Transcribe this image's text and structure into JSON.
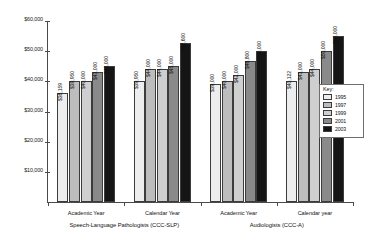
{
  "chart_data": {
    "type": "bar",
    "title": "",
    "xlabel": "",
    "ylabel": "",
    "ylim": [
      0,
      60000
    ],
    "grid": false,
    "legend_position": "right",
    "y_ticks": [
      "$10,000",
      "$20,000",
      "$30,000",
      "$40,000",
      "$50,000",
      "$60,000"
    ],
    "y_tick_values": [
      10000,
      20000,
      30000,
      40000,
      50000,
      60000
    ],
    "series": [
      {
        "name": "1995",
        "color": "#ededed"
      },
      {
        "name": "1997",
        "color": "#bdbdbd"
      },
      {
        "name": "1999",
        "color": "#cfcfcf"
      },
      {
        "name": "2001",
        "color": "#8a8a8a"
      },
      {
        "name": "2003",
        "color": "#151515"
      }
    ],
    "categories": [
      "Academic Year",
      "Calendar Year",
      "Academic Year",
      "Calendar year"
    ],
    "sections": [
      "Speech-Language Pathologists (CCC-SLP)",
      "Audiologists (CCC-A)"
    ],
    "groups": [
      {
        "category": "Academic Year",
        "section": "Speech-Language Pathologists (CCC-SLP)",
        "values": [
          36159,
          39950,
          40000,
          43000,
          45000
        ],
        "labels": [
          "$36,159",
          "$39,950",
          "$40,000",
          "$43,000",
          "$45,000"
        ]
      },
      {
        "category": "Calendar Year",
        "section": "Speech-Language Pathologists (CCC-SLP)",
        "values": [
          39950,
          44000,
          44000,
          45000,
          52600
        ],
        "labels": [
          "$39,950",
          "$44,000",
          "$44,000",
          "$45,000",
          "$52,600"
        ]
      },
      {
        "category": "Academic Year",
        "section": "Audiologists (CCC-A)",
        "values": [
          39000,
          40000,
          42000,
          46800,
          50000
        ],
        "labels": [
          "$39,000",
          "$40,000",
          "$42,000",
          "$46,800",
          "$50,000"
        ]
      },
      {
        "category": "Calendar year",
        "section": "Audiologists (CCC-A)",
        "values": [
          40122,
          43000,
          44000,
          50000,
          55000
        ],
        "labels": [
          "$40,122",
          "$43,000",
          "$44,000",
          "$50,000",
          "$55,000"
        ]
      }
    ]
  },
  "legend": {
    "title": "Key:",
    "items": [
      {
        "label": "1995",
        "color": "#ededed"
      },
      {
        "label": "1997",
        "color": "#bdbdbd"
      },
      {
        "label": "1999",
        "color": "#cfcfcf"
      },
      {
        "label": "2001",
        "color": "#8a8a8a"
      },
      {
        "label": "2003",
        "color": "#151515"
      }
    ]
  }
}
